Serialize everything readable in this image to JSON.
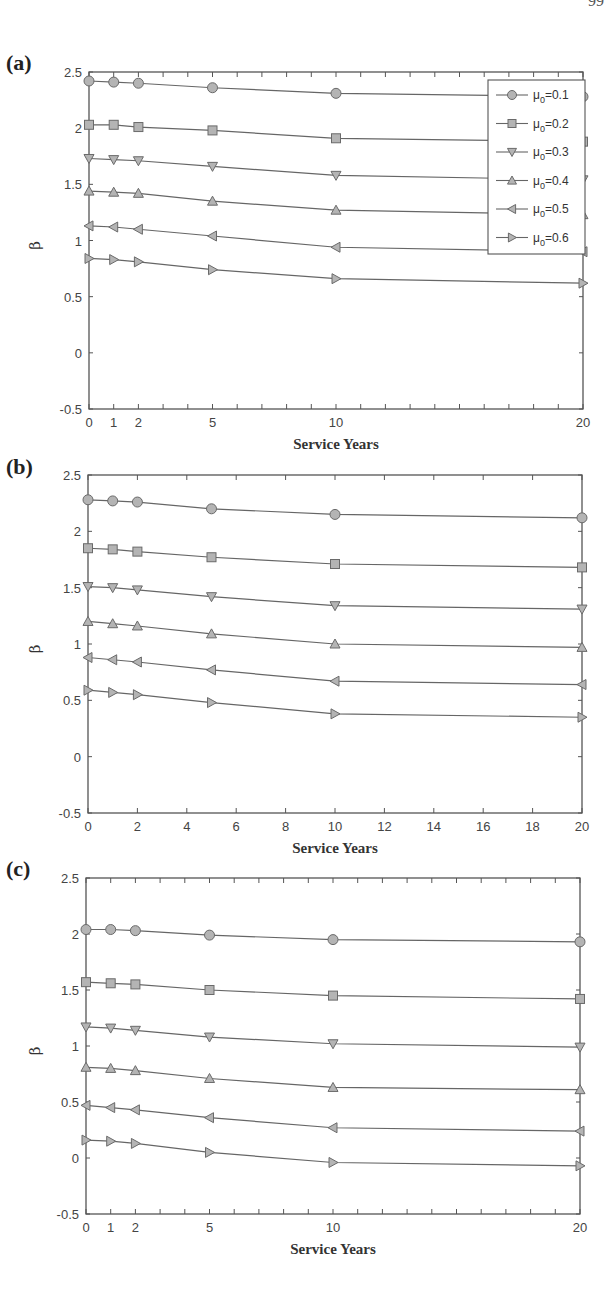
{
  "page": {
    "page_number_fragment": "99"
  },
  "chart_data": [
    {
      "panel_label": "(a)",
      "type": "line",
      "title": "",
      "xlabel": "Service Years",
      "ylabel": "β",
      "xlim": [
        0,
        20
      ],
      "ylim": [
        -0.5,
        2.5
      ],
      "x_ticks": [
        0,
        1,
        2,
        5,
        10,
        20
      ],
      "x_minor_ticks": [
        0,
        1,
        2,
        3,
        4,
        5,
        6,
        7,
        8,
        9,
        10,
        11,
        12,
        13,
        14,
        15,
        16,
        17,
        18,
        19,
        20
      ],
      "y_ticks": [
        -0.5,
        0,
        0.5,
        1,
        1.5,
        2,
        2.5
      ],
      "y_tick_labels": [
        "-0.5",
        "0",
        "0.5",
        "1",
        "1.5",
        "2",
        "2.5"
      ],
      "grid": false,
      "legend_position": "upper right",
      "x": [
        0,
        1,
        2,
        5,
        10,
        20
      ],
      "series": [
        {
          "name": "μ0=0.1",
          "marker": "circle",
          "values": [
            2.42,
            2.41,
            2.4,
            2.36,
            2.31,
            2.28
          ]
        },
        {
          "name": "μ0=0.2",
          "marker": "square",
          "values": [
            2.03,
            2.03,
            2.01,
            1.98,
            1.91,
            1.88
          ]
        },
        {
          "name": "μ0=0.3",
          "marker": "triangle-down",
          "values": [
            1.73,
            1.72,
            1.71,
            1.66,
            1.58,
            1.54
          ]
        },
        {
          "name": "μ0=0.4",
          "marker": "triangle-up",
          "values": [
            1.44,
            1.43,
            1.42,
            1.35,
            1.27,
            1.23
          ]
        },
        {
          "name": "μ0=0.5",
          "marker": "triangle-left",
          "values": [
            1.13,
            1.12,
            1.1,
            1.04,
            0.94,
            0.9
          ]
        },
        {
          "name": "μ0=0.6",
          "marker": "triangle-right",
          "values": [
            0.84,
            0.83,
            0.81,
            0.74,
            0.66,
            0.62
          ]
        }
      ],
      "legend": [
        {
          "sym": "μ",
          "sub": "0",
          "text": "=0.1",
          "marker": "circle"
        },
        {
          "sym": "μ",
          "sub": "0",
          "text": "=0.2",
          "marker": "square"
        },
        {
          "sym": "μ",
          "sub": "0",
          "text": "=0.3",
          "marker": "triangle-down"
        },
        {
          "sym": "μ",
          "sub": "0",
          "text": "=0.4",
          "marker": "triangle-up"
        },
        {
          "sym": "μ",
          "sub": "0",
          "text": "=0.5",
          "marker": "triangle-left"
        },
        {
          "sym": "μ",
          "sub": "0",
          "text": "=0.6",
          "marker": "triangle-right"
        }
      ]
    },
    {
      "panel_label": "(b)",
      "type": "line",
      "title": "",
      "xlabel": "Service Years",
      "ylabel": "β",
      "xlim": [
        0,
        20
      ],
      "ylim": [
        -0.5,
        2.5
      ],
      "x_ticks": [
        0,
        2,
        4,
        6,
        8,
        10,
        12,
        14,
        16,
        18,
        20
      ],
      "x_minor_ticks": [
        0,
        2,
        4,
        6,
        8,
        10,
        12,
        14,
        16,
        18,
        20
      ],
      "y_ticks": [
        -0.5,
        0,
        0.5,
        1,
        1.5,
        2,
        2.5
      ],
      "y_tick_labels": [
        "-0.5",
        "0",
        "0.5",
        "1",
        "1.5",
        "2",
        "2.5"
      ],
      "grid": false,
      "legend_position": "none",
      "x": [
        0,
        1,
        2,
        5,
        10,
        20
      ],
      "series": [
        {
          "name": "μ0=0.1",
          "marker": "circle",
          "values": [
            2.28,
            2.27,
            2.26,
            2.2,
            2.15,
            2.12
          ]
        },
        {
          "name": "μ0=0.2",
          "marker": "square",
          "values": [
            1.85,
            1.84,
            1.82,
            1.77,
            1.71,
            1.68
          ]
        },
        {
          "name": "μ0=0.3",
          "marker": "triangle-down",
          "values": [
            1.51,
            1.5,
            1.48,
            1.42,
            1.34,
            1.31
          ]
        },
        {
          "name": "μ0=0.4",
          "marker": "triangle-up",
          "values": [
            1.2,
            1.18,
            1.16,
            1.09,
            1.0,
            0.97
          ]
        },
        {
          "name": "μ0=0.5",
          "marker": "triangle-left",
          "values": [
            0.88,
            0.86,
            0.84,
            0.77,
            0.67,
            0.64
          ]
        },
        {
          "name": "μ0=0.6",
          "marker": "triangle-right",
          "values": [
            0.59,
            0.57,
            0.55,
            0.48,
            0.38,
            0.35
          ]
        }
      ]
    },
    {
      "panel_label": "(c)",
      "type": "line",
      "title": "",
      "xlabel": "Service Years",
      "ylabel": "β",
      "xlim": [
        0,
        20
      ],
      "ylim": [
        -0.5,
        2.5
      ],
      "x_ticks": [
        0,
        1,
        2,
        5,
        10,
        20
      ],
      "x_minor_ticks": [
        0,
        1,
        2,
        3,
        4,
        5,
        6,
        7,
        8,
        9,
        10,
        11,
        12,
        13,
        14,
        15,
        16,
        17,
        18,
        19,
        20
      ],
      "y_ticks": [
        -0.5,
        0,
        0.5,
        1,
        1.5,
        2,
        2.5
      ],
      "y_tick_labels": [
        "-0.5",
        "0",
        "0.5",
        "1",
        "1.5",
        "2",
        "2.5"
      ],
      "grid": false,
      "legend_position": "none",
      "x": [
        0,
        1,
        2,
        5,
        10,
        20
      ],
      "series": [
        {
          "name": "μ0=0.1",
          "marker": "circle",
          "values": [
            2.04,
            2.04,
            2.03,
            1.99,
            1.95,
            1.93
          ]
        },
        {
          "name": "μ0=0.2",
          "marker": "square",
          "values": [
            1.57,
            1.56,
            1.55,
            1.5,
            1.45,
            1.42
          ]
        },
        {
          "name": "μ0=0.3",
          "marker": "triangle-down",
          "values": [
            1.17,
            1.16,
            1.14,
            1.08,
            1.02,
            0.99
          ]
        },
        {
          "name": "μ0=0.4",
          "marker": "triangle-up",
          "values": [
            0.81,
            0.8,
            0.78,
            0.71,
            0.63,
            0.61
          ]
        },
        {
          "name": "μ0=0.5",
          "marker": "triangle-left",
          "values": [
            0.47,
            0.45,
            0.43,
            0.36,
            0.27,
            0.24
          ]
        },
        {
          "name": "μ0=0.6",
          "marker": "triangle-right",
          "values": [
            0.16,
            0.15,
            0.13,
            0.05,
            -0.04,
            -0.07
          ]
        }
      ]
    }
  ],
  "style": {
    "line_color": "#666666",
    "marker_fill": "#b4b4b4",
    "marker_stroke": "#6a6a6a",
    "axis_color": "#555555"
  }
}
